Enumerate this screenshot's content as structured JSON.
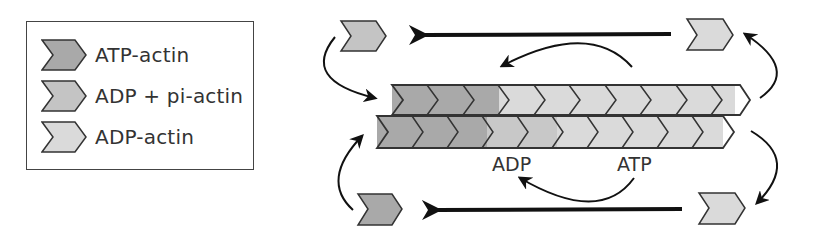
{
  "legend": {
    "items": [
      {
        "key": "atp",
        "label": "ATP-actin",
        "color": "#a9a9a9"
      },
      {
        "key": "adp_pi",
        "label": "ADP + pi-actin",
        "color": "#c4c4c4"
      },
      {
        "key": "adp",
        "label": "ADP-actin",
        "color": "#dadada"
      }
    ]
  },
  "diagram": {
    "labels": {
      "adp": "ADP",
      "atp": "ATP"
    },
    "filament": {
      "top_row": [
        "atp",
        "atp",
        "atp",
        "adp_pi",
        "adp_pi",
        "adp",
        "adp",
        "adp",
        "adp",
        "adp"
      ],
      "bottom_row": [
        "atp",
        "atp",
        "atp",
        "adp_pi",
        "adp_pi",
        "adp",
        "adp",
        "adp",
        "adp",
        "adp"
      ]
    },
    "free_monomers": [
      {
        "position": "top-left",
        "type": "adp_pi"
      },
      {
        "position": "top-right",
        "type": "adp"
      },
      {
        "position": "bottom-left",
        "type": "atp"
      },
      {
        "position": "bottom-right",
        "type": "adp"
      }
    ]
  }
}
